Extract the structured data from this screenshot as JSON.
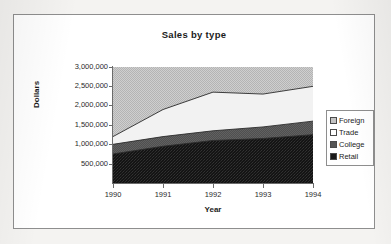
{
  "chart_data": {
    "type": "area",
    "stacked": true,
    "title": "Sales by type",
    "xlabel": "Year",
    "ylabel": "Dollars",
    "categories": [
      "1990",
      "1991",
      "1992",
      "1993",
      "1994"
    ],
    "x": [
      1990,
      1991,
      1992,
      1993,
      1994
    ],
    "ylim": [
      0,
      3000000
    ],
    "ytick_labels": [
      "3,000,000",
      "2,500,000",
      "2,000,000",
      "1,500,000",
      "1,000,000",
      "500,000"
    ],
    "ytick_values": [
      3000000,
      2500000,
      2000000,
      1500000,
      1000000,
      500000
    ],
    "grid": false,
    "legend_position": "right",
    "series": [
      {
        "name": "Retail",
        "color": "#1a1a1a",
        "values": [
          750000,
          950000,
          1100000,
          1150000,
          1250000
        ]
      },
      {
        "name": "College",
        "color": "#555555",
        "values": [
          250000,
          250000,
          250000,
          300000,
          350000
        ]
      },
      {
        "name": "Trade",
        "color": "#ffffff",
        "values": [
          200000,
          700000,
          1000000,
          850000,
          900000
        ]
      },
      {
        "name": "Foreign",
        "color": "#c3c3c3",
        "values": [
          1800000,
          1100000,
          650000,
          700000,
          500000
        ]
      }
    ],
    "cumulative_tops": {
      "retail": [
        750000,
        950000,
        1100000,
        1150000,
        1250000
      ],
      "college": [
        1000000,
        1200000,
        1350000,
        1450000,
        1600000
      ],
      "trade": [
        1200000,
        1900000,
        2350000,
        2300000,
        2500000
      ],
      "foreign": [
        3000000,
        3000000,
        3000000,
        3000000,
        3000000
      ]
    },
    "legend": [
      {
        "label": "Foreign",
        "swatch": "foreign"
      },
      {
        "label": "Trade",
        "swatch": "trade"
      },
      {
        "label": "College",
        "swatch": "college"
      },
      {
        "label": "Retail",
        "swatch": "retail"
      }
    ]
  }
}
